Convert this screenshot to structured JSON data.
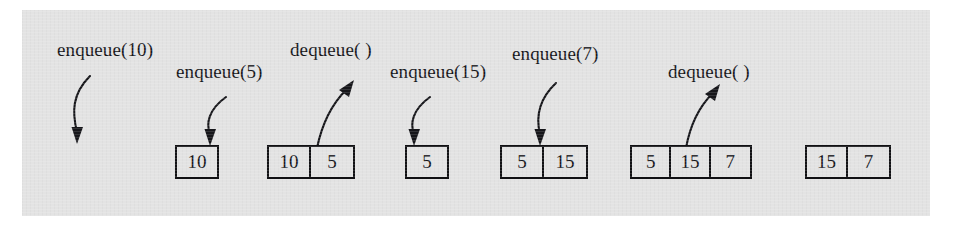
{
  "figure": {
    "panel_color": "#e3e3e3",
    "ink_color": "#16161a",
    "page_background": "#ffffff"
  },
  "operations": [
    {
      "id": "op-enqueue-10",
      "label": "enqueue(10)",
      "kind": "enqueue",
      "value": "10",
      "arrow": "down"
    },
    {
      "id": "op-enqueue-5",
      "label": "enqueue(5)",
      "kind": "enqueue",
      "value": "5",
      "arrow": "down"
    },
    {
      "id": "op-dequeue-1",
      "label": "dequeue( )",
      "kind": "dequeue",
      "value": "",
      "arrow": "up"
    },
    {
      "id": "op-enqueue-15",
      "label": "enqueue(15)",
      "kind": "enqueue",
      "value": "15",
      "arrow": "down"
    },
    {
      "id": "op-enqueue-7",
      "label": "enqueue(7)",
      "kind": "enqueue",
      "value": "7",
      "arrow": "down"
    },
    {
      "id": "op-dequeue-2",
      "label": "dequeue( )",
      "kind": "dequeue",
      "value": "",
      "arrow": "up"
    }
  ],
  "states": [
    {
      "id": "state-0",
      "cells": [],
      "note": "empty queue"
    },
    {
      "id": "state-1",
      "cells": [
        "10"
      ],
      "note": "after enqueue(10)"
    },
    {
      "id": "state-2",
      "cells": [
        "10",
        "5"
      ],
      "note": "after enqueue(5)"
    },
    {
      "id": "state-3",
      "cells": [
        "5"
      ],
      "note": "after dequeue()"
    },
    {
      "id": "state-4",
      "cells": [
        "5",
        "15"
      ],
      "note": "after enqueue(15)"
    },
    {
      "id": "state-5",
      "cells": [
        "5",
        "15",
        "7"
      ],
      "note": "after enqueue(7)"
    },
    {
      "id": "state-6",
      "cells": [
        "15",
        "7"
      ],
      "note": "after dequeue()"
    }
  ],
  "cell_text": {
    "s1c0": "10",
    "s2c0": "10",
    "s2c1": "5",
    "s3c0": "5",
    "s4c0": "5",
    "s4c1": "15",
    "s5c0": "5",
    "s5c1": "15",
    "s5c2": "7",
    "s6c0": "15",
    "s6c1": "7"
  }
}
